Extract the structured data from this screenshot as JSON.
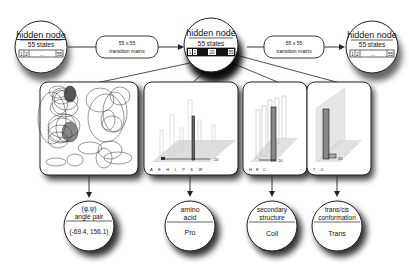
{
  "hidden_nodes": [
    {
      "title": "hidden node",
      "states": "55 states",
      "cells": [
        "1",
        "2",
        "...",
        "55"
      ]
    },
    {
      "title": "hidden node",
      "states": "55 states",
      "cells": [
        "1",
        "2",
        "20",
        "55"
      ]
    },
    {
      "title": "hidden node",
      "states": "55 states",
      "cells": [
        "1",
        "2",
        "...",
        "55"
      ]
    }
  ],
  "transitions": [
    {
      "line1": "55 x 55",
      "line2": "transition matrix"
    },
    {
      "line1": "55 x 55",
      "line2": "transition matrix"
    }
  ],
  "panels": {
    "angle": {
      "label": "angle pair distributions"
    },
    "amino": {
      "axis_letters": "A E H L P S W",
      "state_label": "20"
    },
    "secondary": {
      "axis_letters": "H E C",
      "state_label": "20"
    },
    "transcis": {
      "axis_letters": "T C",
      "state_label": "20"
    }
  },
  "observed_nodes": [
    {
      "title_line1": "(φ,ψ)",
      "title_line2": "angle pair",
      "value": "(-69.4, 156.1)"
    },
    {
      "title_line1": "amino",
      "title_line2": "acid",
      "value": "Pro"
    },
    {
      "title_line1": "secondary",
      "title_line2": "structure",
      "value": "Coil"
    },
    {
      "title_line1": "trans/cis",
      "title_line2": "conformation",
      "value": "Trans"
    }
  ]
}
